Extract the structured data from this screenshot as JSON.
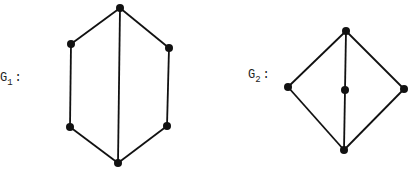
{
  "graphs": [
    {
      "id": "G1",
      "label": {
        "base": "G",
        "subscript": "1",
        "suffix": ":",
        "x": 0,
        "y": 81
      },
      "vertices": [
        {
          "id": "top",
          "x": 120,
          "y": 8
        },
        {
          "id": "upper-left",
          "x": 71,
          "y": 44
        },
        {
          "id": "upper-right",
          "x": 169,
          "y": 48
        },
        {
          "id": "lower-left",
          "x": 70,
          "y": 127
        },
        {
          "id": "lower-right",
          "x": 167,
          "y": 126
        },
        {
          "id": "bottom",
          "x": 118,
          "y": 163
        }
      ],
      "edges": [
        [
          "top",
          "upper-left"
        ],
        [
          "top",
          "upper-right"
        ],
        [
          "top",
          "bottom"
        ],
        [
          "upper-left",
          "lower-left"
        ],
        [
          "upper-right",
          "lower-right"
        ],
        [
          "lower-left",
          "bottom"
        ],
        [
          "lower-right",
          "bottom"
        ]
      ]
    },
    {
      "id": "G2",
      "label": {
        "base": "G",
        "subscript": "2",
        "suffix": ":",
        "x": 248,
        "y": 78
      },
      "vertices": [
        {
          "id": "top",
          "x": 346,
          "y": 31
        },
        {
          "id": "left",
          "x": 288,
          "y": 87
        },
        {
          "id": "middle",
          "x": 345,
          "y": 90
        },
        {
          "id": "right",
          "x": 404,
          "y": 89
        },
        {
          "id": "bottom",
          "x": 344,
          "y": 150
        }
      ],
      "edges": [
        [
          "top",
          "left"
        ],
        [
          "top",
          "right"
        ],
        [
          "top",
          "middle"
        ],
        [
          "middle",
          "bottom"
        ],
        [
          "left",
          "bottom"
        ],
        [
          "right",
          "bottom"
        ]
      ]
    }
  ],
  "style": {
    "stroke": "#111111",
    "node_radius": 4
  }
}
